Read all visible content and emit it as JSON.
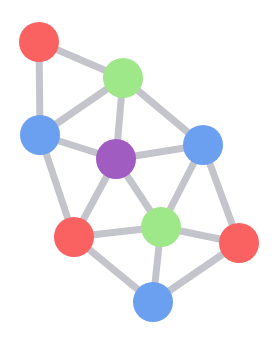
{
  "diagram": {
    "type": "network-graph",
    "node_radius": 20,
    "edge_color": "#c4c4cc",
    "edge_width": 7,
    "colors": {
      "red": "#fa6262",
      "green": "#9ee88a",
      "blue": "#6b9ff0",
      "purple": "#a05cc0"
    },
    "nodes": [
      {
        "id": "n1",
        "color": "red",
        "x": 39,
        "y": 42
      },
      {
        "id": "n2",
        "color": "green",
        "x": 123,
        "y": 78
      },
      {
        "id": "n3",
        "color": "blue",
        "x": 40,
        "y": 135
      },
      {
        "id": "n4",
        "color": "purple",
        "x": 116,
        "y": 159
      },
      {
        "id": "n5",
        "color": "blue",
        "x": 203,
        "y": 145
      },
      {
        "id": "n6",
        "color": "green",
        "x": 161,
        "y": 227
      },
      {
        "id": "n7",
        "color": "red",
        "x": 74,
        "y": 237
      },
      {
        "id": "n8",
        "color": "red",
        "x": 239,
        "y": 243
      },
      {
        "id": "n9",
        "color": "blue",
        "x": 153,
        "y": 302
      }
    ],
    "edges": [
      [
        "n1",
        "n2"
      ],
      [
        "n1",
        "n3"
      ],
      [
        "n2",
        "n3"
      ],
      [
        "n2",
        "n4"
      ],
      [
        "n2",
        "n5"
      ],
      [
        "n3",
        "n4"
      ],
      [
        "n3",
        "n7"
      ],
      [
        "n4",
        "n5"
      ],
      [
        "n4",
        "n7"
      ],
      [
        "n4",
        "n6"
      ],
      [
        "n5",
        "n6"
      ],
      [
        "n5",
        "n8"
      ],
      [
        "n7",
        "n6"
      ],
      [
        "n7",
        "n9"
      ],
      [
        "n6",
        "n8"
      ],
      [
        "n6",
        "n9"
      ],
      [
        "n8",
        "n9"
      ]
    ]
  }
}
